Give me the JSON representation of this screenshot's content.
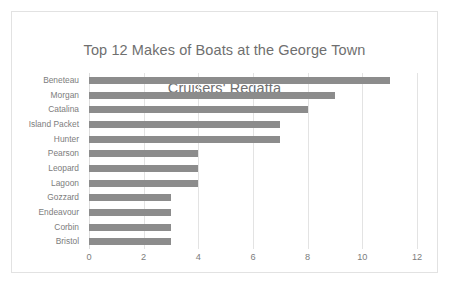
{
  "chart_data": {
    "type": "bar",
    "orientation": "horizontal",
    "title": "Top 12 Makes of Boats at the George Town Cruisers' Regatta",
    "title_line1": "Top 12 Makes of Boats at the George Town",
    "title_line2": "Cruisers' Regatta",
    "xlabel": "",
    "ylabel": "",
    "categories": [
      "Beneteau",
      "Morgan",
      "Catalina",
      "Island Packet",
      "Hunter",
      "Pearson",
      "Leopard",
      "Lagoon",
      "Gozzard",
      "Endeavour",
      "Corbin",
      "Bristol"
    ],
    "values": [
      11,
      9,
      8,
      7,
      7,
      4,
      4,
      4,
      3,
      3,
      3,
      3
    ],
    "xlim": [
      0,
      12
    ],
    "xticks": [
      0,
      2,
      4,
      6,
      8,
      10,
      12
    ],
    "xtick_labels": [
      "0",
      "2",
      "4",
      "6",
      "8",
      "10",
      "12"
    ],
    "grid": "vertical",
    "legend": "none",
    "series": [
      {
        "name": "Count of boats",
        "color": "#8c8c8c",
        "values": [
          11,
          9,
          8,
          7,
          7,
          4,
          4,
          4,
          3,
          3,
          3,
          3
        ]
      }
    ],
    "colors": {
      "bar": "#8c8c8c",
      "gridline": "#e3e3e3",
      "title_text": "#6f6f6f",
      "tick_text": "#7d7d7d",
      "frame_border": "#e2e2e2",
      "background": "#ffffff"
    }
  }
}
